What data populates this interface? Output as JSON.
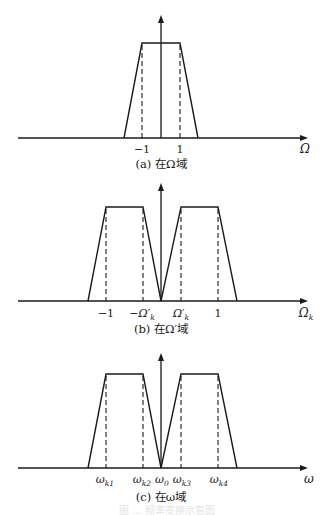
{
  "figure": {
    "panels": [
      {
        "id": "a",
        "caption": "(a) 在Ω域",
        "axis_label": "Ω",
        "axis_label_sub": "",
        "ticks": [
          {
            "label": "−1",
            "sub": ""
          },
          {
            "label": "1",
            "sub": ""
          }
        ],
        "shape": "single-trapezoid",
        "description": "Lowpass prototype response, passband edges at -1 and 1"
      },
      {
        "id": "b",
        "caption": "(b) 在Ω′域",
        "axis_label": "Ω",
        "axis_label_sub": "k",
        "ticks": [
          {
            "label": "−1",
            "sub": ""
          },
          {
            "label": "−Ω′",
            "sub": "k"
          },
          {
            "label": "Ω′",
            "sub": "k"
          },
          {
            "label": "1",
            "sub": ""
          }
        ],
        "shape": "double-trapezoid",
        "description": "Two passbands symmetric about zero, edges at ±Ω'k and ±1"
      },
      {
        "id": "c",
        "caption": "(c) 在ω域",
        "axis_label": "ω",
        "axis_label_sub": "",
        "ticks": [
          {
            "label": "ω",
            "sub": "k1"
          },
          {
            "label": "ω",
            "sub": "k2"
          },
          {
            "label": "ω",
            "sub": "0"
          },
          {
            "label": "ω",
            "sub": "k3"
          },
          {
            "label": "ω",
            "sub": "k4"
          }
        ],
        "shape": "double-trapezoid",
        "description": "Dual-band response with center ω0 and band edges ωk1..ωk4"
      }
    ],
    "footer_caption_faded": "图 … 频率变换示意图"
  }
}
